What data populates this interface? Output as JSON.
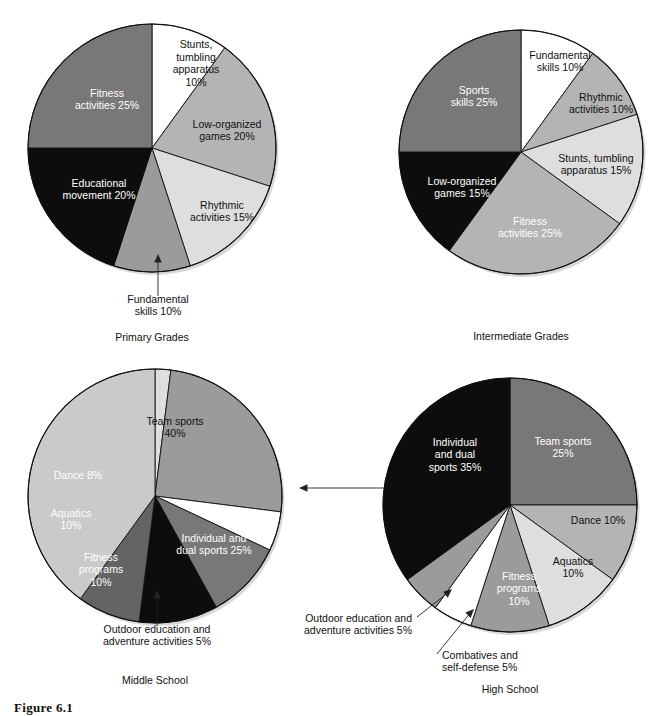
{
  "figure": {
    "caption": "Figure 6.1",
    "charts": [
      {
        "id": "primary-grades",
        "title": "Primary Grades",
        "cx": 152,
        "cy": 148,
        "r": 124,
        "slices": [
          {
            "label": "Stunts,\ntumbling\napparatus\n10%",
            "name": "Stunts, tumbling apparatus",
            "value": 10,
            "color": "#ffffff",
            "dark": false,
            "lx": 196,
            "ly": 64,
            "anchor": "middle"
          },
          {
            "label": "Low-organized\ngames 20%",
            "name": "Low-organized games",
            "value": 20,
            "color": "#b4b4b4",
            "dark": false,
            "lx": 227,
            "ly": 131,
            "anchor": "middle"
          },
          {
            "label": "Rhythmic\nactivities 15%",
            "name": "Rhythmic activities",
            "value": 15,
            "color": "#dedede",
            "dark": false,
            "lx": 222,
            "ly": 212,
            "anchor": "middle"
          },
          {
            "label": "",
            "name": "Fundamental skills",
            "value": 10,
            "color": "#9b9b9b",
            "dark": false,
            "lx": 0,
            "ly": 0,
            "anchor": "middle"
          },
          {
            "label": "Educational\nmovement 20%",
            "name": "Educational movement",
            "value": 20,
            "color": "#0d0d0d",
            "dark": true,
            "lx": 99,
            "ly": 190,
            "anchor": "middle"
          },
          {
            "label": "Fitness\nactivities 25%",
            "name": "Fitness activities",
            "value": 25,
            "color": "#787878",
            "dark": true,
            "lx": 107,
            "ly": 100,
            "anchor": "middle"
          }
        ],
        "callouts": [
          {
            "name": "fundamental-skills-callout",
            "text": "Fundamental\nskills 10%",
            "tx": 158,
            "ty": 306,
            "anchor": "middle",
            "path": "M158,296 L158,258",
            "arrow": "M158,254 L154.2,262.5 L161.8,262.5 Z"
          }
        ]
      },
      {
        "id": "intermediate-grades",
        "title": "Intermediate Grades",
        "cx": 521,
        "cy": 152,
        "r": 122,
        "slices": [
          {
            "label": "Fundamental\nskills 10%",
            "name": "Fundamental skills",
            "value": 10,
            "color": "#ffffff",
            "dark": false,
            "lx": 560,
            "ly": 62,
            "anchor": "middle"
          },
          {
            "label": "Rhythmic\nactivities 10%",
            "name": "Rhythmic activities",
            "value": 10,
            "color": "#b4b4b4",
            "dark": false,
            "lx": 601,
            "ly": 104,
            "anchor": "middle"
          },
          {
            "label": "Stunts, tumbling\napparatus 15%",
            "name": "Stunts, tumbling apparatus",
            "value": 15,
            "color": "#dedede",
            "dark": false,
            "lx": 596,
            "ly": 165,
            "anchor": "middle"
          },
          {
            "label": "Fitness\nactivities 25%",
            "name": "Fitness activities",
            "value": 25,
            "color": "#b4b4b4",
            "dark": true,
            "lx": 530,
            "ly": 228,
            "anchor": "middle"
          },
          {
            "label": "Low-organized\ngames 15%",
            "name": "Low-organized games",
            "value": 15,
            "color": "#0d0d0d",
            "dark": true,
            "lx": 462,
            "ly": 188,
            "anchor": "middle"
          },
          {
            "label": "Sports\nskills 25%",
            "name": "Sports skills",
            "value": 25,
            "color": "#787878",
            "dark": true,
            "lx": 474,
            "ly": 97,
            "anchor": "middle"
          }
        ],
        "callouts": []
      },
      {
        "id": "middle-school",
        "title": "Middle School",
        "cx": 155,
        "cy": 496,
        "r": 127,
        "slices": [
          {
            "label": "",
            "name": "Combatives and self-defense",
            "value": 2,
            "color": "#dedede",
            "dark": false,
            "lx": 0,
            "ly": 0,
            "anchor": "middle"
          },
          {
            "label": "Individual and\ndual sports 25%",
            "name": "Individual and dual sports",
            "value": 25,
            "color": "#9b9b9b",
            "dark": true,
            "lx": 214,
            "ly": 545,
            "anchor": "middle"
          },
          {
            "label": "",
            "name": "Outdoor education and adventure activities",
            "value": 5,
            "color": "#ffffff",
            "dark": false,
            "lx": 0,
            "ly": 0,
            "anchor": "middle"
          },
          {
            "label": "Fitness\nprograms\n10%",
            "name": "Fitness programs",
            "value": 10,
            "color": "#787878",
            "dark": true,
            "lx": 101,
            "ly": 570,
            "anchor": "middle"
          },
          {
            "label": "Aquatics\n10%",
            "name": "Aquatics",
            "value": 10,
            "color": "#0d0d0d",
            "dark": true,
            "lx": 71,
            "ly": 520,
            "anchor": "middle"
          },
          {
            "label": "Dance 8%",
            "name": "Dance",
            "value": 8,
            "color": "#646464",
            "dark": true,
            "lx": 78,
            "ly": 476,
            "anchor": "middle"
          },
          {
            "label": "Team sports\n40%",
            "name": "Team sports",
            "value": 40,
            "color": "#cacaca",
            "dark": false,
            "lx": 175,
            "ly": 428,
            "anchor": "middle"
          }
        ],
        "callouts": [
          {
            "name": "combatives-callout",
            "text": "Combatives and\nself-defense 2%",
            "tx": 407,
            "ty": 482,
            "anchor": "start",
            "path": "M402,488 L303,488",
            "arrow": "M299,488 L307.5,484.2 L307.5,491.8 Z"
          },
          {
            "name": "outdoor-education-callout",
            "text": "Outdoor education and\nadventure activities 5%",
            "tx": 157,
            "ty": 636,
            "anchor": "middle",
            "path": "M157,626 L157,594",
            "arrow": "M157,590 L153.2,598.5 L160.8,598.5 Z"
          }
        ]
      },
      {
        "id": "high-school",
        "title": "High School",
        "cx": 510,
        "cy": 505,
        "r": 127,
        "slices": [
          {
            "label": "Team sports\n25%",
            "name": "Team sports",
            "value": 25,
            "color": "#787878",
            "dark": true,
            "lx": 563,
            "ly": 448,
            "anchor": "middle"
          },
          {
            "label": "Dance 10%",
            "name": "Dance",
            "value": 10,
            "color": "#b4b4b4",
            "dark": false,
            "lx": 598,
            "ly": 521,
            "anchor": "middle"
          },
          {
            "label": "Aquatics\n10%",
            "name": "Aquatics",
            "value": 10,
            "color": "#dedede",
            "dark": false,
            "lx": 573,
            "ly": 568,
            "anchor": "middle"
          },
          {
            "label": "Fitness\nprograms\n10%",
            "name": "Fitness programs",
            "value": 10,
            "color": "#9b9b9b",
            "dark": true,
            "lx": 519,
            "ly": 589,
            "anchor": "middle"
          },
          {
            "label": "",
            "name": "Combatives and self-defense",
            "value": 5,
            "color": "#ffffff",
            "dark": false,
            "lx": 0,
            "ly": 0,
            "anchor": "middle"
          },
          {
            "label": "",
            "name": "Outdoor education and adventure activities",
            "value": 5,
            "color": "#9b9b9b",
            "dark": false,
            "lx": 0,
            "ly": 0,
            "anchor": "middle"
          },
          {
            "label": "Individual\nand dual\nsports 35%",
            "name": "Individual and dual sports",
            "value": 35,
            "color": "#0d0d0d",
            "dark": true,
            "lx": 455,
            "ly": 455,
            "anchor": "middle"
          }
        ],
        "callouts": [
          {
            "name": "outdoor-education-callout",
            "text": "Outdoor education and\nadventure activities 5%",
            "tx": 412,
            "ty": 625,
            "anchor": "end",
            "path": "M417,617 L449,592",
            "arrow": "M452,589 L443.1,591.8 L447.8,597.7 Z"
          },
          {
            "name": "combatives-callout",
            "text": "Combatives and\nself-defense 5%",
            "tx": 442,
            "ty": 662,
            "anchor": "start",
            "path": "M437,654 L471,612",
            "arrow": "M474,609 L465.4,612.6 L470.6,618 Z"
          }
        ]
      }
    ]
  },
  "chart_data": [
    {
      "type": "pie",
      "title": "Primary Grades",
      "categories": [
        "Stunts, tumbling apparatus",
        "Low-organized games",
        "Rhythmic activities",
        "Fundamental skills",
        "Educational movement",
        "Fitness activities"
      ],
      "values": [
        10,
        20,
        15,
        10,
        20,
        25
      ],
      "unit": "percent",
      "legend": "none (direct slice labels)",
      "colors": [
        "#ffffff",
        "#b4b4b4",
        "#dedede",
        "#9b9b9b",
        "#0d0d0d",
        "#787878"
      ]
    },
    {
      "type": "pie",
      "title": "Intermediate Grades",
      "categories": [
        "Fundamental skills",
        "Rhythmic activities",
        "Stunts, tumbling apparatus",
        "Fitness activities",
        "Low-organized games",
        "Sports skills"
      ],
      "values": [
        10,
        10,
        15,
        25,
        15,
        25
      ],
      "unit": "percent",
      "legend": "none (direct slice labels)",
      "colors": [
        "#ffffff",
        "#b4b4b4",
        "#dedede",
        "#b4b4b4",
        "#0d0d0d",
        "#787878"
      ]
    },
    {
      "type": "pie",
      "title": "Middle School",
      "categories": [
        "Combatives and self-defense",
        "Individual and dual sports",
        "Outdoor education and adventure activities",
        "Fitness programs",
        "Aquatics",
        "Dance",
        "Team sports"
      ],
      "values": [
        2,
        25,
        5,
        10,
        10,
        8,
        40
      ],
      "unit": "percent",
      "legend": "none (direct slice labels)",
      "colors": [
        "#dedede",
        "#9b9b9b",
        "#ffffff",
        "#787878",
        "#0d0d0d",
        "#646464",
        "#cacaca"
      ]
    },
    {
      "type": "pie",
      "title": "High School",
      "categories": [
        "Team sports",
        "Dance",
        "Aquatics",
        "Fitness programs",
        "Combatives and self-defense",
        "Outdoor education and adventure activities",
        "Individual and dual sports"
      ],
      "values": [
        25,
        10,
        10,
        10,
        5,
        5,
        35
      ],
      "unit": "percent",
      "legend": "none (direct slice labels)",
      "colors": [
        "#787878",
        "#b4b4b4",
        "#dedede",
        "#9b9b9b",
        "#ffffff",
        "#9b9b9b",
        "#0d0d0d"
      ]
    }
  ]
}
